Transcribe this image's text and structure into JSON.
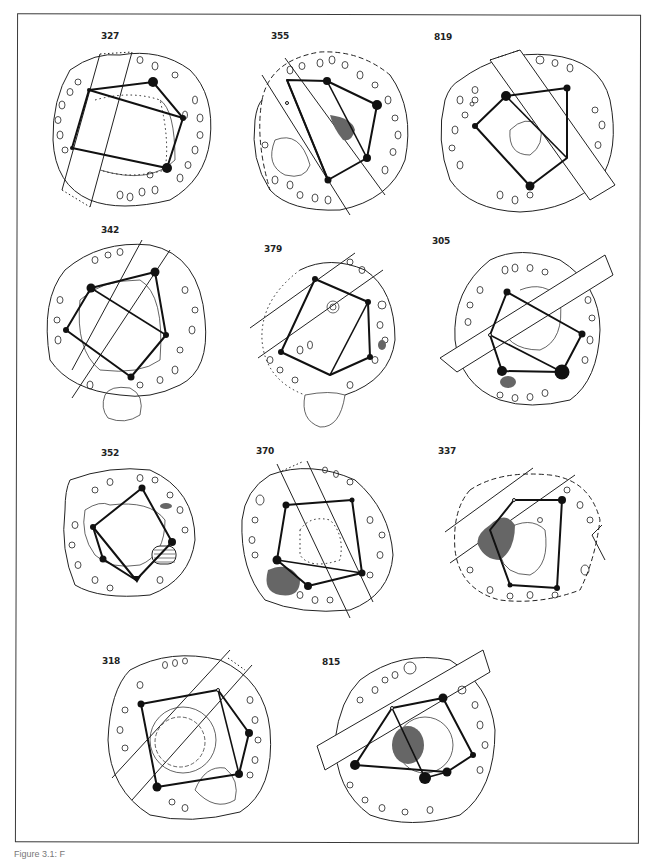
{
  "figure": {
    "caption_visible": "Figure 3.1: F",
    "frame_color": "#3a3a3a",
    "dark_fill": "#111111",
    "gray_fill": "#6a6a6a"
  },
  "cells": [
    {
      "id": "327",
      "label": "327",
      "row": 1,
      "col": 1
    },
    {
      "id": "355",
      "label": "355",
      "row": 1,
      "col": 2
    },
    {
      "id": "819",
      "label": "819",
      "row": 1,
      "col": 3
    },
    {
      "id": "342",
      "label": "342",
      "row": 2,
      "col": 1
    },
    {
      "id": "379",
      "label": "379",
      "row": 2,
      "col": 2
    },
    {
      "id": "305",
      "label": "305",
      "row": 2,
      "col": 3
    },
    {
      "id": "352",
      "label": "352",
      "row": 3,
      "col": 1
    },
    {
      "id": "370",
      "label": "370",
      "row": 3,
      "col": 2
    },
    {
      "id": "337",
      "label": "337",
      "row": 3,
      "col": 3
    },
    {
      "id": "318",
      "label": "318",
      "row": 4,
      "col": 1
    },
    {
      "id": "815",
      "label": "815",
      "row": 4,
      "col": 2
    }
  ]
}
